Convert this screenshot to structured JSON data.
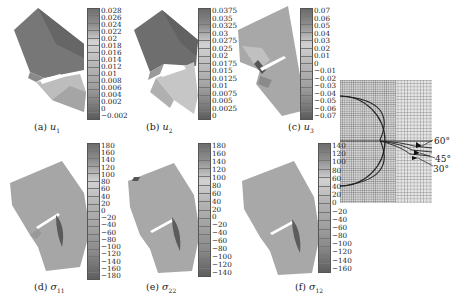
{
  "figure": {
    "panels": [
      {
        "id": "a",
        "caption_prefix": "(a)",
        "caption_var": "u",
        "caption_sub": "1",
        "colorbar_ticks": [
          "0.028",
          "0.026",
          "0.024",
          "0.022",
          "0.02",
          "0.018",
          "0.016",
          "0.014",
          "0.012",
          "0.01",
          "0.008",
          "0.006",
          "0.004",
          "0.002",
          "0",
          "-0.002"
        ]
      },
      {
        "id": "b",
        "caption_prefix": "(b)",
        "caption_var": "u",
        "caption_sub": "2",
        "colorbar_ticks": [
          "0.0375",
          "0.035",
          "0.0325",
          "0.03",
          "0.0275",
          "0.025",
          "0.02",
          "0.0175",
          "0.015",
          "0.0125",
          "0.01",
          "0.0075",
          "0.005",
          "0.0025",
          "0"
        ]
      },
      {
        "id": "c",
        "caption_prefix": "(c)",
        "caption_var": "u",
        "caption_sub": "3",
        "colorbar_ticks": [
          "0.07",
          "0.06",
          "0.05",
          "0.04",
          "0.03",
          "0.02",
          "0.01",
          "0",
          "-0.01",
          "-0.02",
          "-0.03",
          "-0.04",
          "-0.05",
          "-0.06",
          "-0.07"
        ]
      },
      {
        "id": "d",
        "caption_prefix": "(d)",
        "caption_var": "σ",
        "caption_sub": "11",
        "colorbar_ticks": [
          "180",
          "160",
          "140",
          "120",
          "100",
          "80",
          "60",
          "40",
          "20",
          "0",
          "-20",
          "-40",
          "-60",
          "-80",
          "-100",
          "-120",
          "-140",
          "-160",
          "-180"
        ]
      },
      {
        "id": "e",
        "caption_prefix": "(e)",
        "caption_var": "σ",
        "caption_sub": "22",
        "colorbar_ticks": [
          "180",
          "160",
          "140",
          "120",
          "100",
          "80",
          "60",
          "40",
          "20",
          "0",
          "-20",
          "-40",
          "-60",
          "-80",
          "-100",
          "-120",
          "-140"
        ]
      },
      {
        "id": "f",
        "caption_prefix": "(f)",
        "caption_var": "σ",
        "caption_sub": "12",
        "colorbar_ticks": [
          "140",
          "120",
          "100",
          "80",
          "60",
          "40",
          "20",
          "0",
          "-20",
          "-40",
          "-60",
          "-80",
          "-100",
          "-120",
          "-140",
          "-160"
        ]
      }
    ],
    "mesh_inset": {
      "angle_labels": [
        "60°",
        "45°",
        "30°"
      ]
    },
    "colors": {
      "plate_dark": "#6e6e6e",
      "plate_mid": "#9a9a9a",
      "plate_light": "#c4c4c4",
      "colorbar_high": "#707070",
      "colorbar_mid": "#d0d0d0",
      "colorbar_low": "#606060"
    }
  }
}
